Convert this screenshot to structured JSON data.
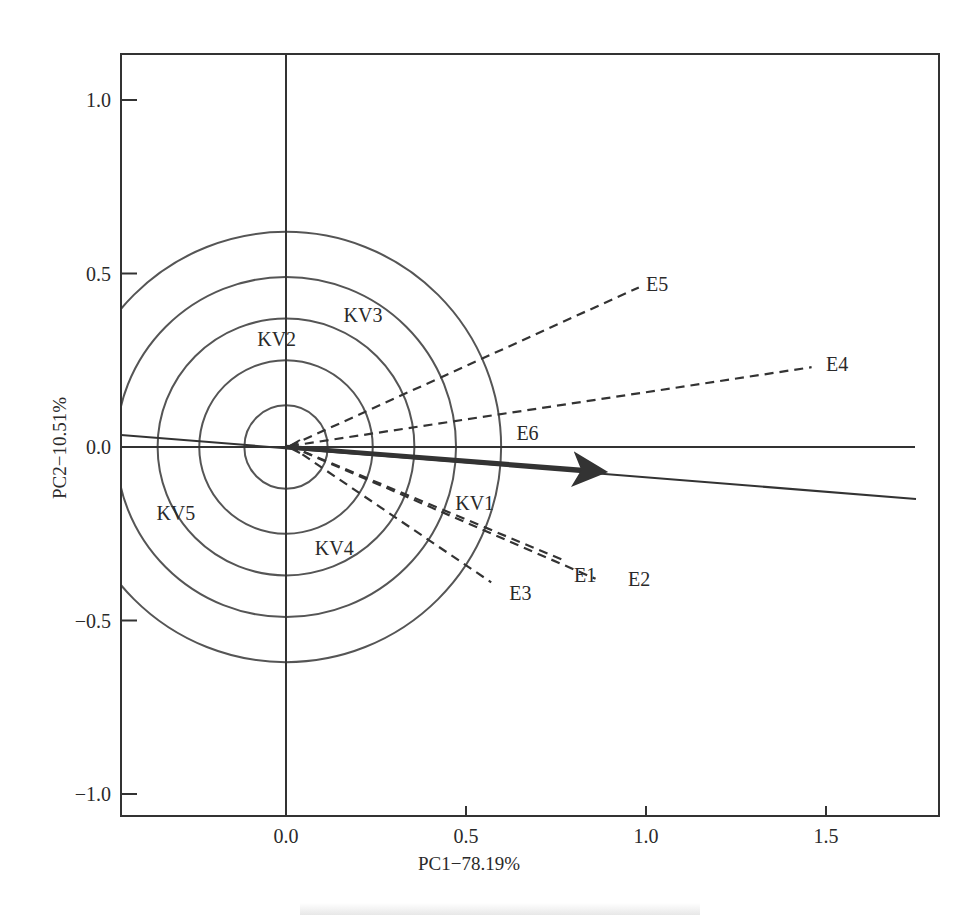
{
  "chart_data": {
    "type": "scatter",
    "subtype": "GGE biplot (discriminativeness vs representativeness / ideal-test-environment view)",
    "title": "",
    "xlabel": "PC1−78.19%",
    "ylabel": "PC2−10.51%",
    "xlim": [
      -0.46,
      1.81
    ],
    "ylim": [
      -1.06,
      1.13
    ],
    "xticks": [
      0.0,
      0.5,
      1.0,
      1.5
    ],
    "xtick_labels": [
      "0.0",
      "0.5",
      "1.0",
      "1.5"
    ],
    "yticks": [
      -1.0,
      -0.5,
      0.0,
      0.5,
      1.0
    ],
    "ytick_labels": [
      "−1.0",
      "−0.5",
      "0.0",
      "0.5",
      "1.0"
    ],
    "grid": false,
    "legend": null,
    "reference_lines": {
      "horizontal_zero": true,
      "vertical_zero": true,
      "average_environment_axis": {
        "from": [
          -0.46,
          0.035
        ],
        "to": [
          1.75,
          -0.15
        ]
      }
    },
    "concentric_circles": {
      "center": [
        0.0,
        0.0
      ],
      "radii": [
        0.12,
        0.25,
        0.37,
        0.49,
        0.62
      ]
    },
    "environment_vectors": [
      {
        "name": "E1",
        "x": 0.78,
        "y": -0.33,
        "style": "dashed"
      },
      {
        "name": "E2",
        "x": 0.86,
        "y": -0.38,
        "style": "dashed"
      },
      {
        "name": "E3",
        "x": 0.57,
        "y": -0.39,
        "style": "dashed"
      },
      {
        "name": "E4",
        "x": 1.46,
        "y": 0.23,
        "style": "dashed"
      },
      {
        "name": "E5",
        "x": 0.98,
        "y": 0.46,
        "style": "dashed"
      },
      {
        "name": "E6",
        "x": 0.87,
        "y": -0.07,
        "style": "bold-arrow"
      }
    ],
    "genotype_labels": [
      {
        "name": "KV1",
        "x": 0.47,
        "y": -0.16
      },
      {
        "name": "KV2",
        "x": -0.08,
        "y": 0.31
      },
      {
        "name": "KV3",
        "x": 0.16,
        "y": 0.38
      },
      {
        "name": "KV4",
        "x": 0.08,
        "y": -0.29
      },
      {
        "name": "KV5",
        "x": -0.36,
        "y": -0.19
      }
    ],
    "environment_label_positions": [
      {
        "name": "E1",
        "x": 0.8,
        "y": -0.37
      },
      {
        "name": "E2",
        "x": 0.95,
        "y": -0.38
      },
      {
        "name": "E3",
        "x": 0.62,
        "y": -0.42
      },
      {
        "name": "E4",
        "x": 1.5,
        "y": 0.24
      },
      {
        "name": "E5",
        "x": 1.0,
        "y": 0.47
      },
      {
        "name": "E6",
        "x": 0.64,
        "y": 0.04
      }
    ]
  },
  "plot_area": {
    "left_px": 121,
    "top_px": 54,
    "right_px": 939,
    "bottom_px": 816,
    "origin_px": [
      286,
      447
    ],
    "px_per_unit_x": 360,
    "px_per_unit_y": 347
  }
}
